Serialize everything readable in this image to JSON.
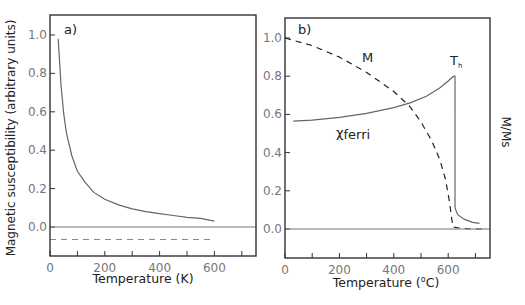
{
  "chart_data": [
    {
      "type": "line",
      "panel_label": "a)",
      "title": "",
      "xlabel": "Temperature (K)",
      "ylabel": "Magnetic susceptibility (arbitrary units)",
      "xlim": [
        0,
        750
      ],
      "ylim": [
        -0.15,
        1.1
      ],
      "x_ticks": [
        0,
        100,
        200,
        300,
        400,
        500,
        600,
        700
      ],
      "x_tick_labels": [
        "0",
        "200",
        "400",
        "600"
      ],
      "y_ticks": [
        0.0,
        0.2,
        0.4,
        0.6,
        0.8,
        1.0
      ],
      "y_tick_labels": [
        "0.0",
        "0.2",
        "0.4",
        "0.6",
        "0.8",
        "1.0"
      ],
      "grid": false,
      "series": [
        {
          "name": "paramagnetic (Curie law)",
          "style": "solid",
          "x": [
            30,
            40,
            50,
            60,
            80,
            100,
            130,
            160,
            200,
            250,
            300,
            350,
            400,
            450,
            500,
            550,
            600
          ],
          "y": [
            0.98,
            0.74,
            0.59,
            0.49,
            0.37,
            0.29,
            0.23,
            0.18,
            0.145,
            0.115,
            0.095,
            0.08,
            0.07,
            0.06,
            0.05,
            0.045,
            0.03
          ]
        },
        {
          "name": "diamagnetic",
          "style": "dashed",
          "x": [
            0,
            600
          ],
          "y": [
            -0.065,
            -0.065
          ]
        },
        {
          "name": "zero line",
          "style": "solid",
          "x": [
            0,
            750
          ],
          "y": [
            0.0,
            0.0
          ]
        }
      ]
    },
    {
      "type": "line",
      "panel_label": "b)",
      "title": "",
      "xlabel": "Temperature (°C)",
      "ylabel": "",
      "y2label": "M/Ms",
      "xlim": [
        0,
        750
      ],
      "ylim": [
        -0.15,
        1.1
      ],
      "x_ticks": [
        0,
        100,
        200,
        300,
        400,
        500,
        600,
        700
      ],
      "x_tick_labels": [
        "0",
        "200",
        "400",
        "600"
      ],
      "y_ticks": [
        0.0,
        0.2,
        0.4,
        0.6,
        0.8,
        1.0
      ],
      "y_tick_labels": [
        "0.0",
        "0.2",
        "0.4",
        "0.6",
        "0.8",
        "1.0"
      ],
      "grid": false,
      "annotations": [
        "M",
        "χferri",
        "Th"
      ],
      "series": [
        {
          "name": "χferri",
          "style": "solid",
          "x": [
            30,
            100,
            200,
            300,
            400,
            460,
            520,
            570,
            600,
            620,
            625,
            625,
            635,
            660,
            690,
            715
          ],
          "y": [
            0.565,
            0.57,
            0.585,
            0.605,
            0.635,
            0.66,
            0.695,
            0.74,
            0.775,
            0.8,
            0.8,
            0.11,
            0.075,
            0.05,
            0.035,
            0.03
          ]
        },
        {
          "name": "M",
          "style": "dashed",
          "x": [
            0,
            100,
            200,
            300,
            400,
            460,
            500,
            540,
            570,
            590,
            605,
            612,
            618,
            640,
            680,
            730
          ],
          "y": [
            1.0,
            0.96,
            0.9,
            0.82,
            0.72,
            0.64,
            0.56,
            0.46,
            0.36,
            0.26,
            0.14,
            0.06,
            0.01,
            0.005,
            0.0,
            0.0
          ]
        },
        {
          "name": "zero line",
          "style": "solid",
          "x": [
            0,
            750
          ],
          "y": [
            0.0,
            0.0
          ]
        }
      ]
    }
  ],
  "figure": {
    "panel_a_label": "a)",
    "panel_b_label": "b)",
    "panel_a_xlabel": "Temperature (K)",
    "panel_a_ylabel": "Magnetic susceptibility (arbitrary units)",
    "panel_b_xlabel_prefix": "Temperature (",
    "panel_b_xlabel_degree": "o",
    "panel_b_xlabel_suffix": "C)",
    "panel_b_y2label": "M/Ms",
    "anno_M": "M",
    "anno_chi_symbol": "χ",
    "anno_chi_sub": "ferri",
    "anno_T": "T",
    "anno_T_sub": "h",
    "colors": {
      "axis": "#333333",
      "curve": "#666666",
      "dashed_a": "#888888",
      "dashed_b": "#222222",
      "tick_label": "#777777"
    }
  }
}
